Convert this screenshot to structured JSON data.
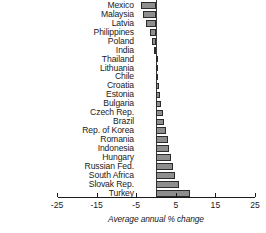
{
  "chart_data": {
    "type": "bar",
    "orientation": "horizontal",
    "title": "",
    "subtitle": "",
    "xlabel": "Average annual % change",
    "ylabel": "",
    "xlim": [
      -25,
      25
    ],
    "xticks": [
      -25,
      -15,
      -5,
      5,
      15,
      25
    ],
    "xtick_labels": [
      "-25",
      "-15",
      "-5",
      "5",
      "15",
      "25"
    ],
    "grid": false,
    "legend": null,
    "zero_reference": 0,
    "bar_color": "#8e8e8e",
    "bar_edge_color": "#2b2b2b",
    "categories": [
      "Mexico",
      "Malaysia",
      "Latvia",
      "Philippines",
      "Poland",
      "India",
      "Thailand",
      "Lithuania",
      "Chile",
      "Croatia",
      "Estonia",
      "Bulgaria",
      "Czech Rep.",
      "Brazil",
      "Rep. of Korea",
      "Romania",
      "Indonesia",
      "Hungary",
      "Russian Fed.",
      "South Africa",
      "Slovak Rep.",
      "Turkey"
    ],
    "values": [
      -3.8,
      -3.2,
      -2.6,
      -1.6,
      -0.9,
      -0.5,
      0.3,
      0.4,
      0.6,
      0.8,
      1.0,
      1.3,
      1.7,
      2.1,
      2.6,
      3.0,
      3.4,
      3.8,
      4.2,
      4.8,
      5.7,
      8.6
    ]
  }
}
